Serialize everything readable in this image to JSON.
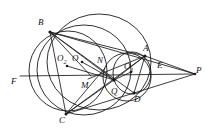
{
  "figure": {
    "stroke_color": "#1a1a1a",
    "background_color": "#ffffff",
    "width": 217,
    "height": 135
  },
  "labels": [
    {
      "id": "B",
      "text": "B",
      "sub": "",
      "x": 38,
      "y": 18
    },
    {
      "id": "A",
      "text": "A",
      "sub": "",
      "x": 143,
      "y": 44
    },
    {
      "id": "P",
      "text": "P",
      "sub": "",
      "x": 196,
      "y": 66
    },
    {
      "id": "E",
      "text": "E",
      "sub": "",
      "x": 157,
      "y": 61
    },
    {
      "id": "O2",
      "text": "O",
      "sub": "2",
      "x": 57,
      "y": 54
    },
    {
      "id": "O",
      "text": "O",
      "sub": "",
      "x": 72,
      "y": 54
    },
    {
      "id": "N",
      "text": "N",
      "sub": "",
      "x": 97,
      "y": 56
    },
    {
      "id": "O1",
      "text": "O",
      "sub": "1",
      "x": 124,
      "y": 62
    },
    {
      "id": "F",
      "text": "F",
      "sub": "",
      "x": 11,
      "y": 77
    },
    {
      "id": "M",
      "text": "M",
      "sub": "",
      "x": 81,
      "y": 81
    },
    {
      "id": "Q",
      "text": "Q",
      "sub": "",
      "x": 111,
      "y": 87
    },
    {
      "id": "D",
      "text": "D",
      "sub": "",
      "x": 134,
      "y": 95
    },
    {
      "id": "C",
      "text": "C",
      "sub": "",
      "x": 59,
      "y": 116
    }
  ],
  "points": [
    {
      "id": "B",
      "x": 50,
      "y": 32
    },
    {
      "id": "A",
      "x": 145,
      "y": 56
    },
    {
      "id": "P",
      "x": 195,
      "y": 74
    },
    {
      "id": "C",
      "x": 66,
      "y": 114
    },
    {
      "id": "D",
      "x": 134,
      "y": 93
    },
    {
      "id": "E",
      "x": 152,
      "y": 70
    },
    {
      "id": "F",
      "x": 22,
      "y": 77
    },
    {
      "id": "M",
      "x": 91,
      "y": 76
    },
    {
      "id": "N",
      "x": 105,
      "y": 68
    },
    {
      "id": "Q",
      "x": 114,
      "y": 80
    },
    {
      "id": "O",
      "x": 82,
      "y": 62
    },
    {
      "id": "O1",
      "x": 131,
      "y": 72
    },
    {
      "id": "O2",
      "x": 67,
      "y": 66
    }
  ],
  "dotted_centers": [
    "O",
    "O1",
    "O2"
  ],
  "circles": [
    {
      "id": "circumcircle-abc",
      "cx": 82,
      "cy": 69,
      "r": 46
    },
    {
      "id": "circle-o2-left",
      "cx": 67,
      "cy": 70,
      "r": 38
    },
    {
      "id": "circle-through-b-d",
      "cx": 97,
      "cy": 60,
      "r": 52
    },
    {
      "id": "circle-o1-small",
      "cx": 131,
      "cy": 72,
      "r": 20
    },
    {
      "id": "circle-q-small",
      "cx": 126,
      "cy": 76,
      "r": 24
    }
  ],
  "segments": [
    {
      "id": "BC",
      "from": "B",
      "to": "C"
    },
    {
      "id": "BA",
      "from": "B",
      "to": "A"
    },
    {
      "id": "BP",
      "from": "B",
      "to": "P"
    },
    {
      "id": "BQ",
      "from": "B",
      "to": "Q"
    },
    {
      "id": "BD",
      "from": "B",
      "to": "D"
    },
    {
      "id": "BM",
      "from": "B",
      "to": "M"
    },
    {
      "id": "CA",
      "from": "C",
      "to": "A"
    },
    {
      "id": "CD",
      "from": "C",
      "to": "D"
    },
    {
      "id": "CQ",
      "from": "C",
      "to": "Q"
    },
    {
      "id": "CN",
      "from": "C",
      "to": "N"
    },
    {
      "id": "AP",
      "from": "A",
      "to": "P"
    },
    {
      "id": "AD",
      "from": "A",
      "to": "D"
    },
    {
      "id": "AQ",
      "from": "A",
      "to": "Q"
    },
    {
      "id": "DP",
      "from": "D",
      "to": "P"
    },
    {
      "id": "FP",
      "from": "F",
      "to": "P"
    },
    {
      "id": "MA",
      "from": "M",
      "to": "A"
    },
    {
      "id": "O2Q",
      "from": "O2",
      "to": "Q"
    },
    {
      "id": "OQ",
      "from": "O",
      "to": "Q"
    },
    {
      "id": "QO1",
      "from": "Q",
      "to": "O1"
    }
  ]
}
